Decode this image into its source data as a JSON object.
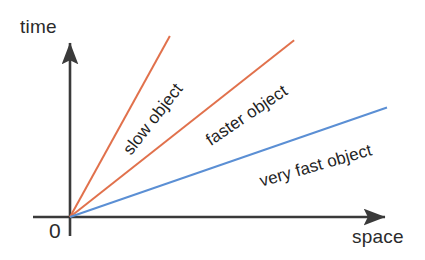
{
  "figure": {
    "background": "#ffffff",
    "axis_color": "#3a3a3a",
    "text_color": "#2b2b2b"
  },
  "axes": {
    "y_label": "time",
    "x_label": "space",
    "origin_label": "0"
  },
  "chart_data": {
    "type": "line",
    "title": "",
    "subtitle": "",
    "xlabel": "space",
    "ylabel": "time",
    "grid": false,
    "legend": "inline-annotations",
    "xlim": [
      0,
      1
    ],
    "ylim": [
      0,
      1
    ],
    "axis_arrows": true,
    "origin": {
      "label": "0",
      "x": 0,
      "y": 0
    },
    "series": [
      {
        "name": "slow object",
        "color": "#e1714c",
        "annotation": "slow object",
        "annotation_rotation_deg": -52,
        "slope_note": "steepest worldline, largest time per unit space",
        "x": [
          0,
          0.315
        ],
        "y": [
          0,
          1.0
        ]
      },
      {
        "name": "faster object",
        "color": "#e1714c",
        "annotation": "faster object",
        "annotation_rotation_deg": -34,
        "slope_note": "intermediate worldline",
        "x": [
          0,
          0.707
        ],
        "y": [
          0,
          0.977
        ]
      },
      {
        "name": "very fast object",
        "color": "#5b8fd4",
        "annotation": "very fast object",
        "annotation_rotation_deg": -16,
        "slope_note": "shallowest worldline, least time per unit space",
        "x": [
          0,
          1.0
        ],
        "y": [
          0,
          0.605
        ]
      }
    ]
  },
  "annotations": {
    "slow": "slow object",
    "faster": "faster object",
    "very_fast": "very fast object"
  }
}
